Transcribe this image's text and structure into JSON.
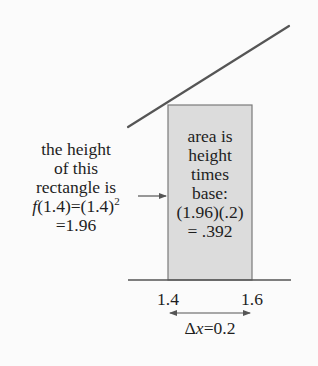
{
  "diagram": {
    "colors": {
      "background": "#fbfbfb",
      "line": "#555555",
      "rect_fill": "#dcdcdc",
      "rect_border": "#7a7a7a",
      "text": "#1e1e1e"
    },
    "left_note": {
      "lines": [
        "the height",
        "of this",
        "rectangle is"
      ],
      "formula_fn": "f",
      "formula_rest": "(1.4)=(1.4)",
      "formula_exp": "2",
      "result": "=1.96"
    },
    "rect_note": {
      "lines": [
        "area is",
        "height",
        "times",
        "base:",
        "(1.96)(.2)",
        "= .392"
      ]
    },
    "axis": {
      "tick_left": "1.4",
      "tick_right": "1.6",
      "delta_symbol": "Δ",
      "delta_var": "x",
      "delta_value": "=0.2"
    },
    "icons": {
      "pointer_arrow": "right-arrow",
      "width_arrow": "double-headed-arrow"
    }
  }
}
